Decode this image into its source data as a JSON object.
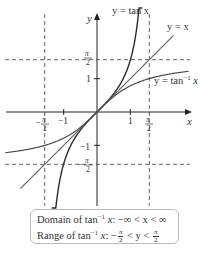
{
  "chart_data": {
    "type": "line",
    "title": "",
    "xlabel": "x",
    "ylabel": "y",
    "xlim": [
      -2.9,
      2.9
    ],
    "ylim": [
      -3.0,
      2.9
    ],
    "grid": false,
    "x_ticks": [
      {
        "value": -1.5708,
        "label_num": "π",
        "label_den": "2",
        "label_sign": "−"
      },
      {
        "value": -1,
        "label": "−1"
      },
      {
        "value": 1,
        "label": "1"
      },
      {
        "value": 1.5708,
        "label_num": "π",
        "label_den": "2",
        "label_sign": ""
      }
    ],
    "y_ticks": [
      {
        "value": 1.5708,
        "label_num": "π",
        "label_den": "2",
        "label_sign": ""
      },
      {
        "value": 1,
        "label": "1"
      },
      {
        "value": -1,
        "label": "−1"
      },
      {
        "value": -1.5708,
        "label_num": "π",
        "label_den": "2",
        "label_sign": "−"
      }
    ],
    "asymptotes": {
      "vertical": [
        -1.5708,
        1.5708
      ],
      "horizontal": [
        -1.5708,
        1.5708
      ],
      "style": "dashed"
    },
    "series": [
      {
        "name": "y = tan x",
        "function": "tan(x)",
        "domain": [
          -1.36,
          1.36
        ],
        "color": "#2b2b2b"
      },
      {
        "name": "y = x",
        "function": "x",
        "domain": [
          -2.3,
          2.3
        ],
        "color": "#6e6e6e"
      },
      {
        "name": "y = tan⁻¹ x",
        "function": "atan(x)",
        "domain": [
          -2.75,
          2.75
        ],
        "color": "#4a4a4a"
      }
    ],
    "annotations": [
      {
        "text": "y = tan x",
        "x": 0.8,
        "y": 2.9
      },
      {
        "text": "y = x",
        "x": 2.35,
        "y": 2.35
      },
      {
        "text": "y = tan⁻¹ x",
        "x": 1.7,
        "y": 0.9
      }
    ]
  },
  "labels": {
    "x_axis": "x",
    "y_axis": "y",
    "curve_tan": "y = tan x",
    "curve_identity": "y = x",
    "curve_arctan_prefix": "y = tan",
    "curve_arctan_sup": "−1",
    "curve_arctan_suffix": " x",
    "tick_neg1": "−1",
    "tick_1": "1",
    "pi": "π",
    "two": "2",
    "minus": "−"
  },
  "info_box": {
    "domain_prefix": "Domain of tan",
    "domain_sup": "−1",
    "domain_var": " x",
    "domain_rest": ": −∞ < x < ∞",
    "range_prefix": "Range of tan",
    "range_sup": "−1",
    "range_var": " x",
    "range_colon": ": −",
    "range_pi": "π",
    "range_two": "2",
    "range_mid": " < y < ",
    "range_pi2": "π",
    "range_two2": "2"
  },
  "colors": {
    "axis": "#222222",
    "dashed": "#555555",
    "tan": "#2b2b2b",
    "identity": "#6e6e6e",
    "arctan": "#4a4a4a",
    "box_border": "#b9b9b9"
  }
}
